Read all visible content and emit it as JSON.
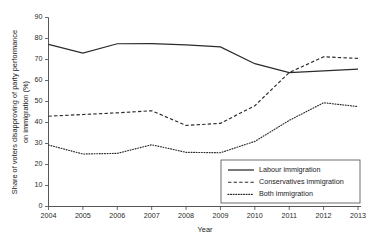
{
  "chart_data": {
    "type": "line",
    "title": "",
    "xlabel": "Year",
    "ylabel": "Share of voters disapproving of party performance on immigration (%)",
    "ylabel_line1": "Share of voters disapproving of party performance",
    "ylabel_line2": "on immigration (%)",
    "categories": [
      "2004",
      "2005",
      "2006",
      "2007",
      "2008",
      "2009",
      "2010",
      "2011",
      "2012",
      "2013"
    ],
    "xlim": [
      2004,
      2013
    ],
    "ylim": [
      0,
      90
    ],
    "yticks": [
      0,
      10,
      20,
      30,
      40,
      50,
      60,
      70,
      80,
      90
    ],
    "ytick_labels": [
      "0",
      "10",
      "20",
      "30",
      "40",
      "50",
      "60",
      "70",
      "80",
      "90"
    ],
    "xtick_labels": [
      "2004",
      "2005",
      "2006",
      "2007",
      "2008",
      "2009",
      "2010",
      "2011",
      "2012",
      "2013"
    ],
    "grid": false,
    "legend_position": "lower right",
    "series": [
      {
        "name": "Labour immigration",
        "style": "solid",
        "color": "#2b2b2b",
        "values": [
          77.2,
          73.0,
          77.5,
          77.6,
          77.0,
          76.0,
          68.0,
          63.8,
          64.6,
          65.4
        ]
      },
      {
        "name": "Conservatives immigration",
        "style": "dashed",
        "color": "#2b2b2b",
        "values": [
          43.0,
          43.8,
          44.6,
          45.6,
          38.6,
          39.6,
          48.0,
          63.8,
          71.3,
          70.5
        ]
      },
      {
        "name": "Both immigration",
        "style": "dotted",
        "color": "#2b2b2b",
        "values": [
          29.3,
          25.0,
          25.3,
          29.4,
          25.8,
          25.6,
          31.0,
          41.0,
          49.4,
          47.6
        ]
      }
    ],
    "legend_entries": [
      {
        "label": "Labour immigration",
        "style": "solid"
      },
      {
        "label": "Conservatives immigration",
        "style": "dashed"
      },
      {
        "label": "Both immigration",
        "style": "dotted"
      }
    ]
  }
}
